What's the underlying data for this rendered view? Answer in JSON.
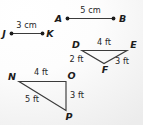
{
  "figure": {
    "background_color": "#f1f1f1",
    "stroke_color": "#3b3b3b",
    "text_color": "#1c1c1c",
    "segments": [
      {
        "id": "segment-ab",
        "endpoints": [
          "A",
          "B"
        ],
        "label_a": "A",
        "label_b": "B",
        "measure": "5 cm",
        "unit": "cm",
        "value": 5
      },
      {
        "id": "segment-jk",
        "endpoints": [
          "J",
          "K"
        ],
        "label_j": "J",
        "label_k": "K",
        "measure": "3 cm",
        "unit": "cm",
        "value": 3
      }
    ],
    "triangles": [
      {
        "id": "triangle-def",
        "vertices": [
          "D",
          "E",
          "F"
        ],
        "label_d": "D",
        "label_e": "E",
        "label_f": "F",
        "side_de": "4 ft",
        "side_df": "2 ft",
        "side_fe": "3 ft",
        "unit": "ft"
      },
      {
        "id": "triangle-nop",
        "vertices": [
          "N",
          "O",
          "P"
        ],
        "label_n": "N",
        "label_o": "O",
        "label_p": "P",
        "side_no": "4 ft",
        "side_op": "3 ft",
        "side_np": "5 ft",
        "unit": "ft"
      }
    ]
  }
}
